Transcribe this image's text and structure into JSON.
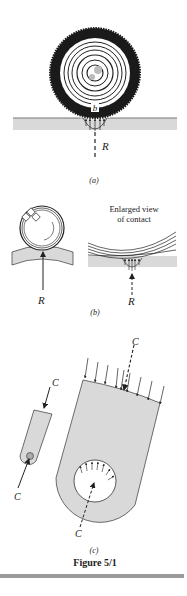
{
  "figure": {
    "caption": "Figure 5/1",
    "rule_color": "#9a9a9a"
  },
  "panel_a": {
    "label": "(a)",
    "contact_width_label": "b",
    "reaction_label": "R",
    "description": "Tire on flat road with distributed contact pressure over width b"
  },
  "panel_b": {
    "label": "(b)",
    "reaction_label": "R",
    "enlarged_title_line1": "Enlarged view",
    "enlarged_title_line2": "of contact",
    "description": "Ball bearing on curved race with enlarged view of contact pressure"
  },
  "panel_c": {
    "label": "(c)",
    "force_label": "C",
    "description": "Link with pin; enlarged view of distributed bearing pressure on pin hole"
  },
  "colors": {
    "ink": "#222222",
    "fill_gray": "#d9d9d9",
    "dark_tire": "#1a1a1a"
  }
}
